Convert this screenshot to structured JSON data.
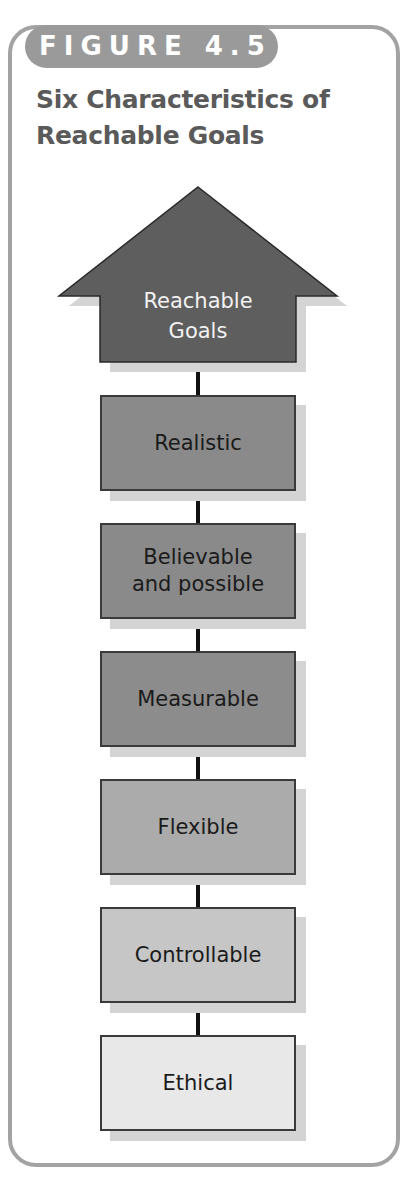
{
  "figure": {
    "label": "FIGURE 4.5",
    "title_lines": [
      "Six Characteristics of",
      "Reachable Goals"
    ]
  },
  "diagram": {
    "top": {
      "label_lines": [
        "Reachable",
        "Goals"
      ],
      "shape": "up-arrow",
      "color": "#5e5e5e"
    },
    "steps": [
      {
        "label": "Realistic",
        "color": "#8a8a8a"
      },
      {
        "label": "Believable and possible",
        "lines": [
          "Believable",
          "and possible"
        ],
        "color": "#8a8a8a"
      },
      {
        "label": "Measurable",
        "color": "#8c8c8c"
      },
      {
        "label": "Flexible",
        "color": "#ababab"
      },
      {
        "label": "Controllable",
        "color": "#c6c6c6"
      },
      {
        "label": "Ethical",
        "color": "#e8e8e8"
      }
    ]
  },
  "colors": {
    "frame": "#a3a3a3",
    "pill": "#9a9a9a",
    "title": "#5a5a5a",
    "shadow": "#d4d4d4",
    "connector": "#111111"
  }
}
